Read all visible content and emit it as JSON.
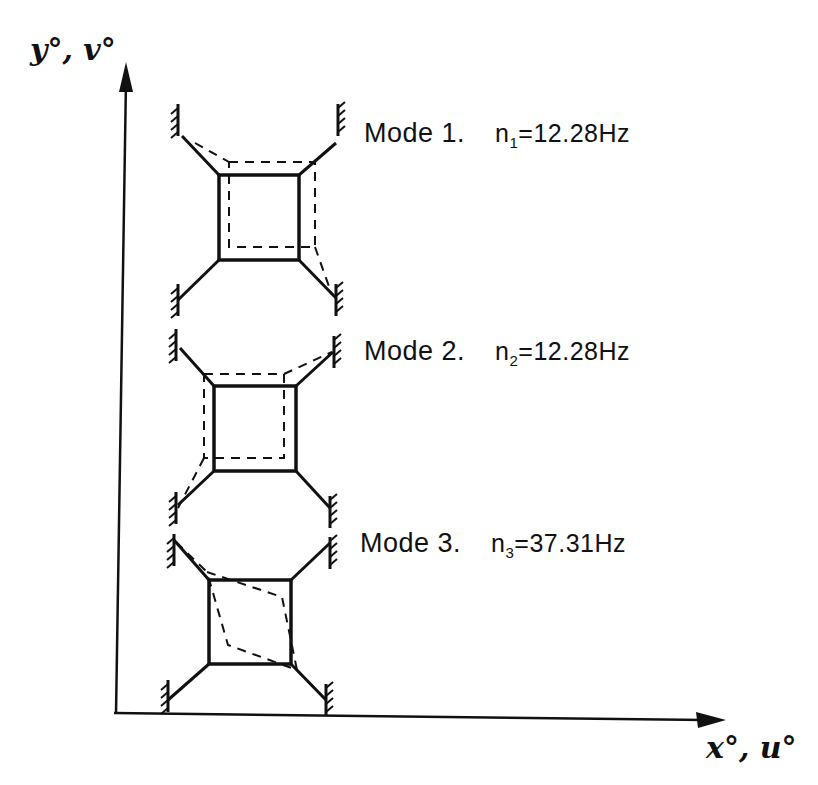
{
  "diagram": {
    "axes": {
      "y_label": "y°, v°",
      "x_label": "x°, u°"
    },
    "modes": [
      {
        "name": "Mode 1.",
        "symbol": "n",
        "subscript": "1",
        "equals": "=",
        "value": "12.28",
        "unit": "Hz",
        "frequency_text": "n₁=12.28Hz",
        "displacement": "translation up and right"
      },
      {
        "name": "Mode 2.",
        "symbol": "n",
        "subscript": "2",
        "equals": "=",
        "value": "12.28",
        "unit": "Hz",
        "frequency_text": "n₂=12.28Hz",
        "displacement": "translation up and left"
      },
      {
        "name": "Mode 3.",
        "symbol": "n",
        "subscript": "3",
        "equals": "=",
        "value": "37.31",
        "unit": "Hz",
        "frequency_text": "n₃=37.31Hz",
        "displacement": "rotation"
      }
    ],
    "legend": {
      "solid": "undeformed position",
      "dashed": "deformed mode shape"
    },
    "colors": {
      "ink": "#111111",
      "background": "#ffffff"
    }
  }
}
